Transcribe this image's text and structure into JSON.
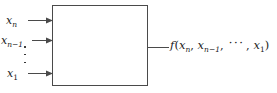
{
  "figure": {
    "type": "block-diagram",
    "box": {
      "label": "",
      "border_color": "#4a4a4a",
      "fill_color": "#ffffff"
    },
    "inputs": [
      {
        "name": "x-n",
        "var": "x",
        "sub": "n",
        "sub_upright": false,
        "arrow": "right-arrow-icon"
      },
      {
        "name": "x-n-minus-1",
        "var": "x",
        "sub": "n−1",
        "sub_upright": false,
        "arrow": "right-arrow-icon"
      },
      {
        "name": "x-1",
        "var": "x",
        "sub": "1",
        "sub_upright": true,
        "arrow": "right-arrow-icon"
      }
    ],
    "vertical_ellipsis": "⋮",
    "output": {
      "name": "output-expression",
      "fn": "f",
      "open": "(",
      "terms": [
        {
          "var": "x",
          "sub": "n",
          "sub_upright": false
        },
        {
          "var": "x",
          "sub": "n−1",
          "sub_upright": false
        },
        {
          "var": "x",
          "sub": "1",
          "sub_upright": true
        }
      ],
      "separator": ",",
      "ellipsis": "···",
      "close": ")",
      "text": "f(x_n, x_{n-1}, ⋯, x_1)"
    },
    "colors": {
      "background": "#ffffff",
      "ink": "#1a1a1a",
      "line": "#4a4a4a"
    }
  }
}
